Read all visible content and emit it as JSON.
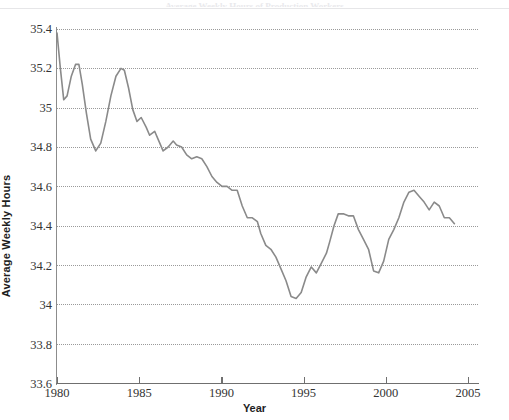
{
  "figure": {
    "title": "Average Weekly Hours of Production Workers",
    "background_color": "#ffffff",
    "line_color": "#8a8a8a",
    "grid_color": "#9a9a9a",
    "axis_color": "#6f6f6f"
  },
  "axes": {
    "ylabel": "Average Weekly Hours",
    "xlabel": "Year",
    "yticks": [
      "33.6",
      "33.8",
      "34",
      "34.2",
      "34.4",
      "34.6",
      "34.8",
      "35",
      "35.2",
      "35.4"
    ],
    "xticks": [
      "1980",
      "1985",
      "1990",
      "1995",
      "2000",
      "2005"
    ]
  },
  "chart_data": {
    "type": "line",
    "title": "Average Weekly Hours of Production Workers",
    "xlabel": "Year",
    "ylabel": "Average Weekly Hours",
    "xlim": [
      1980,
      2005
    ],
    "ylim": [
      33.6,
      35.4
    ],
    "grid": true,
    "legend": "none",
    "series": [
      {
        "name": "Average Weekly Hours",
        "color": "#8a8a8a",
        "x": [
          1980.0,
          1980.2,
          1980.4,
          1980.6,
          1980.85,
          1981.1,
          1981.3,
          1981.5,
          1981.75,
          1982.0,
          1982.3,
          1982.6,
          1982.9,
          1983.2,
          1983.5,
          1983.8,
          1984.0,
          1984.25,
          1984.5,
          1984.75,
          1985.0,
          1985.3,
          1985.5,
          1985.8,
          1986.0,
          1986.3,
          1986.6,
          1986.9,
          1987.1,
          1987.4,
          1987.7,
          1988.0,
          1988.3,
          1988.6,
          1988.9,
          1989.2,
          1989.5,
          1989.8,
          1990.1,
          1990.4,
          1990.7,
          1991.0,
          1991.3,
          1991.6,
          1991.9,
          1992.1,
          1992.4,
          1992.7,
          1993.0,
          1993.3,
          1993.6,
          1993.9,
          1994.2,
          1994.5,
          1994.8,
          1995.1,
          1995.4,
          1995.7,
          1996.0,
          1996.2,
          1996.45,
          1996.7,
          1997.0,
          1997.3,
          1997.6,
          1997.9,
          1998.2,
          1998.5,
          1998.8,
          1999.1,
          1999.4,
          1999.7,
          2000.0,
          2000.3,
          2000.6,
          2000.9,
          2001.2,
          2001.5,
          2001.8,
          2002.1,
          2002.4,
          2002.7,
          2003.0,
          2003.3,
          2003.6
        ],
        "y": [
          35.38,
          35.2,
          35.04,
          35.06,
          35.16,
          35.22,
          35.22,
          35.12,
          34.97,
          34.84,
          34.78,
          34.82,
          34.93,
          35.06,
          35.16,
          35.2,
          35.19,
          35.1,
          34.99,
          34.93,
          34.95,
          34.9,
          34.86,
          34.88,
          34.84,
          34.78,
          34.8,
          34.83,
          34.81,
          34.8,
          34.76,
          34.74,
          34.75,
          34.74,
          34.7,
          34.65,
          34.62,
          34.6,
          34.6,
          34.58,
          34.58,
          34.5,
          34.44,
          34.44,
          34.42,
          34.36,
          34.3,
          34.28,
          34.24,
          34.18,
          34.12,
          34.04,
          34.03,
          34.06,
          34.14,
          34.19,
          34.16,
          34.21,
          34.26,
          34.32,
          34.4,
          34.46,
          34.46,
          34.45,
          34.45,
          34.38,
          34.33,
          34.28,
          34.17,
          34.16,
          34.22,
          34.33,
          34.38,
          34.44,
          34.52,
          34.57,
          34.58,
          34.55,
          34.52,
          34.48,
          34.52,
          34.5,
          34.44,
          34.44,
          34.41
        ]
      }
    ],
    "notes": {
      "start_value": "35.38",
      "end_value": "33.72",
      "minimum": "33.72",
      "maximum": "35.38"
    }
  }
}
